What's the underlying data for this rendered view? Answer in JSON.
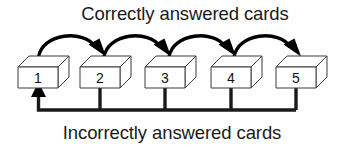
{
  "diagram": {
    "title_top": "Correctly answered cards",
    "title_bottom": "Incorrectly answered cards",
    "boxes": [
      {
        "label": "1"
      },
      {
        "label": "2"
      },
      {
        "label": "3"
      },
      {
        "label": "4"
      },
      {
        "label": "5"
      }
    ],
    "colors": {
      "background": "#ffffff",
      "stroke": "#000000",
      "box_outline": "#3c3c3c",
      "text": "#1a1a1a"
    },
    "flow": {
      "forward_label": "Correctly answered cards",
      "forward_direction": "left-to-right",
      "return_label": "Incorrectly answered cards",
      "return_direction": "right-to-left-into-box-1"
    }
  }
}
